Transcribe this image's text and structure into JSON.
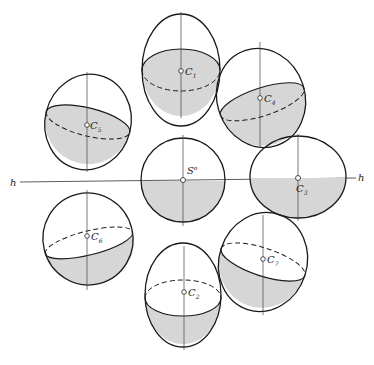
{
  "figure": {
    "colors": {
      "stroke": "#1a1a1a",
      "fill": "#d6d6d6",
      "background": "#ffffff",
      "axis": "#444444"
    },
    "horizon": {
      "label_left": "h",
      "label_right": "h"
    },
    "center_sphere": {
      "label": "S",
      "label_sup": "o"
    },
    "spheres": [
      {
        "id": "C1",
        "base": "C",
        "sub": "1",
        "sup": "*"
      },
      {
        "id": "C2",
        "base": "C",
        "sub": "2",
        "sup": "*"
      },
      {
        "id": "C3",
        "base": "C",
        "sub": "3",
        "sup": "*"
      },
      {
        "id": "C4",
        "base": "C",
        "sub": "4",
        "sup": "*"
      },
      {
        "id": "C5",
        "base": "C",
        "sub": "5",
        "sup": "*"
      },
      {
        "id": "C6",
        "base": "C",
        "sub": "6",
        "sup": "*"
      },
      {
        "id": "C7",
        "base": "C",
        "sub": "7",
        "sup": "*"
      }
    ]
  }
}
